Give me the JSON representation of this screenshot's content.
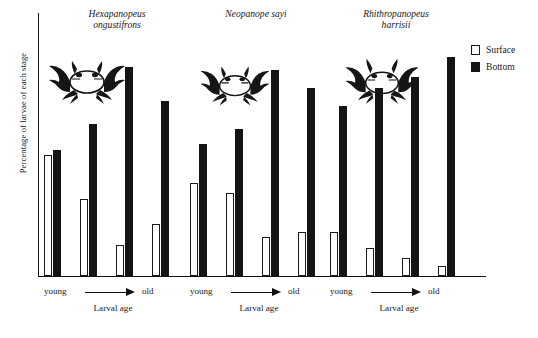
{
  "chart_data": {
    "type": "bar",
    "title": "",
    "xlabel": "Larval age",
    "ylabel": "Percentage of larvae of each stage",
    "ylim": [
      0,
      100
    ],
    "grid": false,
    "legend": {
      "position": "right",
      "entries": [
        {
          "name": "Surface",
          "color": "#ffffff",
          "style": "open-square"
        },
        {
          "name": "Bottom",
          "color": "#141414",
          "style": "filled-square"
        }
      ]
    },
    "axis_annotations": {
      "young": "young",
      "old": "old",
      "arrow": "young-to-old-arrow"
    },
    "panels": [
      {
        "species": "Hexapanopeus\nongustifrons",
        "categories": [
          "stage 1",
          "stage 2",
          "stage 3",
          "stage 4"
        ],
        "series": [
          {
            "name": "Surface",
            "values": [
              47,
              30,
              12,
              20
            ]
          },
          {
            "name": "Bottom",
            "values": [
              49,
              59,
              81,
              68
            ]
          }
        ]
      },
      {
        "species": "Neopanope sayi",
        "categories": [
          "stage 1",
          "stage 2",
          "stage 3",
          "stage 4"
        ],
        "series": [
          {
            "name": "Surface",
            "values": [
              36,
              32,
              15,
              17
            ]
          },
          {
            "name": "Bottom",
            "values": [
              51,
              57,
              80,
              73
            ]
          }
        ]
      },
      {
        "species": "Rhithropanopeus\nharrisii",
        "categories": [
          "stage 1",
          "stage 2",
          "stage 3",
          "stage 4"
        ],
        "series": [
          {
            "name": "Surface",
            "values": [
              17,
              11,
              7,
              4
            ]
          },
          {
            "name": "Bottom",
            "values": [
              66,
              73,
              77,
              85
            ]
          }
        ]
      }
    ]
  }
}
